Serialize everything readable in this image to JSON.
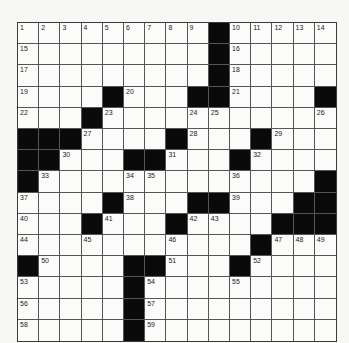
{
  "puzzle": {
    "size": 15,
    "rows": [
      "         #     ",
      "         #     ",
      "         #     ",
      "    #   ##    #",
      "   #           ",
      "###    #   #   ",
      "##   ##   #    ",
      "#             #",
      "    #   ##   ##",
      "   #   #    ###",
      "           #   ",
      "#    ##   #    ",
      "     #         ",
      "     #         ",
      "     #         "
    ],
    "numbers": [
      {
        "r": 0,
        "c": 0,
        "n": "1"
      },
      {
        "r": 0,
        "c": 1,
        "n": "2"
      },
      {
        "r": 0,
        "c": 2,
        "n": "3"
      },
      {
        "r": 0,
        "c": 3,
        "n": "4"
      },
      {
        "r": 0,
        "c": 4,
        "n": "5"
      },
      {
        "r": 0,
        "c": 5,
        "n": "6"
      },
      {
        "r": 0,
        "c": 6,
        "n": "7"
      },
      {
        "r": 0,
        "c": 7,
        "n": "8"
      },
      {
        "r": 0,
        "c": 8,
        "n": "9"
      },
      {
        "r": 0,
        "c": 10,
        "n": "10"
      },
      {
        "r": 0,
        "c": 11,
        "n": "11"
      },
      {
        "r": 0,
        "c": 12,
        "n": "12"
      },
      {
        "r": 0,
        "c": 13,
        "n": "13"
      },
      {
        "r": 0,
        "c": 14,
        "n": "14"
      },
      {
        "r": 1,
        "c": 0,
        "n": "15"
      },
      {
        "r": 1,
        "c": 10,
        "n": "16"
      },
      {
        "r": 2,
        "c": 0,
        "n": "17"
      },
      {
        "r": 2,
        "c": 10,
        "n": "18"
      },
      {
        "r": 3,
        "c": 0,
        "n": "19"
      },
      {
        "r": 3,
        "c": 5,
        "n": "20"
      },
      {
        "r": 3,
        "c": 10,
        "n": "21"
      },
      {
        "r": 4,
        "c": 0,
        "n": "22"
      },
      {
        "r": 4,
        "c": 4,
        "n": "23"
      },
      {
        "r": 4,
        "c": 8,
        "n": "24"
      },
      {
        "r": 4,
        "c": 9,
        "n": "25"
      },
      {
        "r": 4,
        "c": 14,
        "n": "26"
      },
      {
        "r": 5,
        "c": 3,
        "n": "27"
      },
      {
        "r": 5,
        "c": 8,
        "n": "28"
      },
      {
        "r": 5,
        "c": 12,
        "n": "29"
      },
      {
        "r": 6,
        "c": 2,
        "n": "30"
      },
      {
        "r": 6,
        "c": 7,
        "n": "31"
      },
      {
        "r": 6,
        "c": 11,
        "n": "32"
      },
      {
        "r": 7,
        "c": 1,
        "n": "33"
      },
      {
        "r": 7,
        "c": 5,
        "n": "34"
      },
      {
        "r": 7,
        "c": 6,
        "n": "35"
      },
      {
        "r": 7,
        "c": 10,
        "n": "36"
      },
      {
        "r": 8,
        "c": 0,
        "n": "37"
      },
      {
        "r": 8,
        "c": 5,
        "n": "38"
      },
      {
        "r": 8,
        "c": 10,
        "n": "39"
      },
      {
        "r": 9,
        "c": 0,
        "n": "40"
      },
      {
        "r": 9,
        "c": 4,
        "n": "41"
      },
      {
        "r": 9,
        "c": 8,
        "n": "42"
      },
      {
        "r": 9,
        "c": 9,
        "n": "43"
      },
      {
        "r": 10,
        "c": 0,
        "n": "44"
      },
      {
        "r": 10,
        "c": 3,
        "n": "45"
      },
      {
        "r": 10,
        "c": 7,
        "n": "46"
      },
      {
        "r": 10,
        "c": 12,
        "n": "47"
      },
      {
        "r": 10,
        "c": 13,
        "n": "48"
      },
      {
        "r": 10,
        "c": 14,
        "n": "49"
      },
      {
        "r": 11,
        "c": 1,
        "n": "50"
      },
      {
        "r": 11,
        "c": 7,
        "n": "51"
      },
      {
        "r": 11,
        "c": 11,
        "n": "52"
      },
      {
        "r": 12,
        "c": 0,
        "n": "53"
      },
      {
        "r": 12,
        "c": 6,
        "n": "54"
      },
      {
        "r": 12,
        "c": 10,
        "n": "55"
      },
      {
        "r": 13,
        "c": 0,
        "n": "56"
      },
      {
        "r": 13,
        "c": 6,
        "n": "57"
      },
      {
        "r": 14,
        "c": 0,
        "n": "58"
      },
      {
        "r": 14,
        "c": 6,
        "n": "59"
      }
    ]
  },
  "colors": {
    "block": "#0a0a0a",
    "cell": "#fbfbfa",
    "line": "#555555"
  }
}
